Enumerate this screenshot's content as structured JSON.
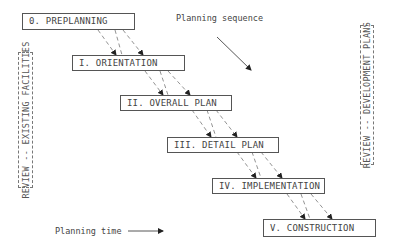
{
  "diagram": {
    "title_label": "Planning sequence",
    "time_label": "Planning time",
    "phases": [
      {
        "id": "0",
        "label": "0. PREPLANNING"
      },
      {
        "id": "I",
        "label": "I. ORIENTATION"
      },
      {
        "id": "II",
        "label": "II. OVERALL PLAN"
      },
      {
        "id": "III",
        "label": "III. DETAIL PLAN"
      },
      {
        "id": "IV",
        "label": "IV. IMPLEMENTATION"
      },
      {
        "id": "V",
        "label": "V. CONSTRUCTION"
      }
    ],
    "side_boxes": {
      "left": "REVIEW -- EXISTING FACILITIES",
      "right": "REVIEW -- DEVELOPMENT PLANS"
    },
    "colors": {
      "line": "#555555",
      "dashed": "#777777",
      "text": "#444444",
      "background": "#ffffff"
    }
  }
}
